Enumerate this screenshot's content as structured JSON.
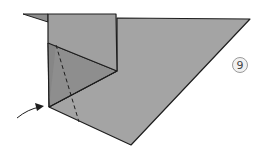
{
  "diagram": {
    "type": "origami-step",
    "step_number": "9",
    "colors": {
      "paper": "#a4a4a4",
      "paper_shadow": "#8e8e8e",
      "paper_top_flap": "#9c9c9c",
      "edge": "#1e1e1e",
      "background": "#ffffff",
      "step_circle_fill": "#f2f2f2",
      "step_circle_stroke": "#9a9a9a"
    },
    "annotations": {
      "fold_line": "dashed valley fold line",
      "arrow": "curved arrow pointing to lower-left corner"
    }
  }
}
